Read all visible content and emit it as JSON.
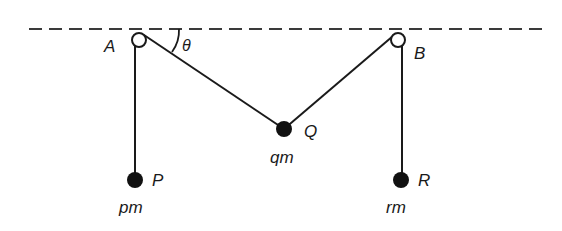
{
  "diagram": {
    "type": "pulley-system",
    "reference_line": {
      "style": "dashed",
      "y": 29,
      "x_start": 29,
      "x_end": 548
    },
    "pulleys": [
      {
        "id": "A",
        "label": "A",
        "cx": 139,
        "cy": 40,
        "r": 7
      },
      {
        "id": "B",
        "label": "B",
        "cx": 398,
        "cy": 40,
        "r": 7
      }
    ],
    "masses": [
      {
        "id": "P",
        "label": "P",
        "mass_label": "pm",
        "cx": 135,
        "cy": 180,
        "r": 8
      },
      {
        "id": "Q",
        "label": "Q",
        "mass_label": "qm",
        "cx": 284,
        "cy": 129,
        "r": 8
      },
      {
        "id": "R",
        "label": "R",
        "mass_label": "rm",
        "cx": 401,
        "cy": 180,
        "r": 8
      }
    ],
    "angle": {
      "label": "θ",
      "at": "A",
      "between": "horizontal and string AQ"
    },
    "colors": {
      "ink": "#1a1a1a",
      "background": "#ffffff"
    }
  }
}
